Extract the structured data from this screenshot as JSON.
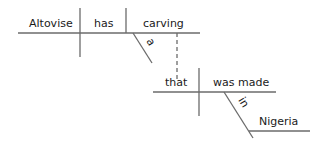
{
  "diagram": {
    "type": "sentence-diagram",
    "main_clause": {
      "subject": "Altovise",
      "verb": "has",
      "direct_object": "carving",
      "modifiers": {
        "carving": "a"
      }
    },
    "relative_clause": {
      "subject": "that",
      "verb": "was made",
      "prepositional_phrase": {
        "preposition": "in",
        "object": "Nigeria"
      },
      "attached_to": "carving"
    },
    "colors": {
      "line": "#6b6b6b",
      "text": "#1a1a1a",
      "background": "#ffffff"
    }
  }
}
